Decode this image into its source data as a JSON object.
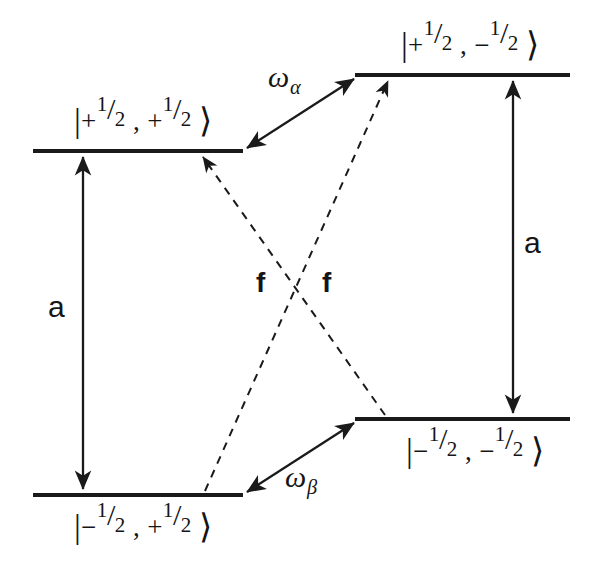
{
  "figure": {
    "type": "energy-level-diagram",
    "background_color": "#ffffff",
    "line_color": "#1a1a1a",
    "width": 594,
    "height": 578
  },
  "levels": [
    {
      "id": "upper-left",
      "label_bar": "|",
      "label_sign1": "+",
      "label_num1": "1",
      "label_slash1": "/",
      "label_den1": "2",
      "label_comma": ",",
      "label_sign2": "+",
      "label_num2": "1",
      "label_slash2": "/",
      "label_den2": "2",
      "label_angle": "⟩",
      "label_plain": "|+1/2, +1/2⟩",
      "x1": 33,
      "x2": 243,
      "y": 151
    },
    {
      "id": "upper-right",
      "label_bar": "|",
      "label_sign1": "+",
      "label_num1": "1",
      "label_slash1": "/",
      "label_den1": "2",
      "label_comma": ",",
      "label_sign2": "−",
      "label_num2": "1",
      "label_slash2": "/",
      "label_den2": "2",
      "label_angle": "⟩",
      "label_plain": "|+1/2, −1/2⟩",
      "x1": 355,
      "x2": 570,
      "y": 75
    },
    {
      "id": "lower-left",
      "label_bar": "|",
      "label_sign1": "−",
      "label_num1": "1",
      "label_slash1": "/",
      "label_den1": "2",
      "label_comma": ",",
      "label_sign2": "+",
      "label_num2": "1",
      "label_slash2": "/",
      "label_den2": "2",
      "label_angle": "⟩",
      "label_plain": "|−1/2, +1/2⟩",
      "x1": 33,
      "x2": 243,
      "y": 495
    },
    {
      "id": "lower-right",
      "label_bar": "|",
      "label_sign1": "−",
      "label_num1": "1",
      "label_slash1": "/",
      "label_den1": "2",
      "label_comma": ",",
      "label_sign2": "−",
      "label_num2": "1",
      "label_slash2": "/",
      "label_den2": "2",
      "label_angle": "⟩",
      "label_plain": "|−1/2, −1/2⟩",
      "x1": 355,
      "x2": 570,
      "y": 419
    }
  ],
  "transitions": {
    "hyperfine_left": {
      "label": "a",
      "style": "solid",
      "heads": "double",
      "from": "lower-left",
      "to": "upper-left"
    },
    "hyperfine_right": {
      "label": "a",
      "style": "solid",
      "heads": "double",
      "from": "lower-right",
      "to": "upper-right"
    },
    "omega_alpha": {
      "symbol": "ω",
      "subscript": "α",
      "label": "ωα",
      "style": "solid",
      "heads": "double",
      "from": "upper-left",
      "to": "upper-right"
    },
    "omega_beta": {
      "symbol": "ω",
      "subscript": "β",
      "label": "ωβ",
      "style": "solid",
      "heads": "double",
      "from": "lower-left",
      "to": "lower-right"
    },
    "flip_flop_left": {
      "label": "f",
      "style": "dashed",
      "heads": "single",
      "from": "lower-right",
      "to": "upper-left"
    },
    "flip_flop_right": {
      "label": "f",
      "style": "dashed",
      "heads": "single",
      "from": "lower-left",
      "to": "upper-right"
    }
  }
}
